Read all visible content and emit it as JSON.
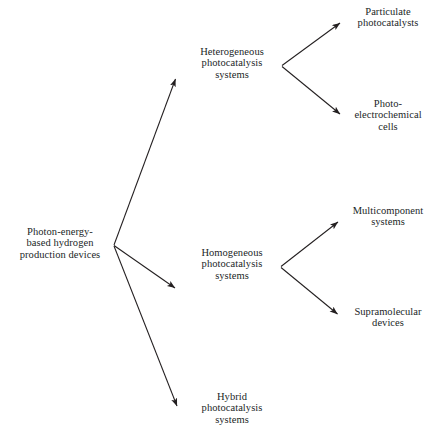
{
  "diagram": {
    "type": "tree-hierarchy",
    "orientation": "left-to-right",
    "background_color": "#ffffff",
    "line_color": "#231f20",
    "text_color": "#221f1f",
    "root": {
      "id": "photon-energy-based-hydrogen-production-devices",
      "label": "Photon-energy-based hydrogen production devices",
      "lines": [
        "Photon-energy-",
        "based hydrogen",
        "production devices"
      ]
    },
    "level2": [
      {
        "id": "heterogeneous-photocatalysis-systems",
        "label": "Heterogeneous photocatalysis systems",
        "lines": [
          "Heterogeneous",
          "photocatalysis",
          "systems"
        ]
      },
      {
        "id": "homogeneous-photocatalysis-systems",
        "label": "Homogeneous photocatalysis systems",
        "lines": [
          "Homogeneous",
          "photocatalysis",
          "systems"
        ]
      },
      {
        "id": "hybrid-photocatalysis-systems",
        "label": "Hybrid photocatalysis systems",
        "lines": [
          "Hybrid",
          "photocatalysis",
          "systems"
        ]
      }
    ],
    "level3": [
      {
        "id": "particulate-photocatalysts",
        "label": "Particulate photocatalysts",
        "lines": [
          "Particulate",
          "photocatalysts"
        ],
        "parent": "heterogeneous-photocatalysis-systems"
      },
      {
        "id": "photo-electrochemical-cells",
        "label": "Photo-electrochemical cells",
        "lines": [
          "Photo-",
          "electrochemical",
          "cells"
        ],
        "parent": "heterogeneous-photocatalysis-systems"
      },
      {
        "id": "multicomponent-systems",
        "label": "Multicomponent systems",
        "lines": [
          "Multicomponent",
          "systems"
        ],
        "parent": "homogeneous-photocatalysis-systems"
      },
      {
        "id": "supramolecular-devices",
        "label": "Supramolecular devices",
        "lines": [
          "Supramolecular",
          "devices"
        ],
        "parent": "homogeneous-photocatalysis-systems"
      }
    ],
    "edges": [
      {
        "from": "root",
        "to": "heterogeneous-photocatalysis-systems",
        "arrow": true
      },
      {
        "from": "root",
        "to": "homogeneous-photocatalysis-systems",
        "arrow": true
      },
      {
        "from": "root",
        "to": "hybrid-photocatalysis-systems",
        "arrow": true
      },
      {
        "from": "heterogeneous-photocatalysis-systems",
        "to": "particulate-photocatalysts",
        "arrow": true
      },
      {
        "from": "heterogeneous-photocatalysis-systems",
        "to": "photo-electrochemical-cells",
        "arrow": true
      },
      {
        "from": "homogeneous-photocatalysis-systems",
        "to": "multicomponent-systems",
        "arrow": true
      },
      {
        "from": "homogeneous-photocatalysis-systems",
        "to": "supramolecular-devices",
        "arrow": true
      }
    ]
  }
}
